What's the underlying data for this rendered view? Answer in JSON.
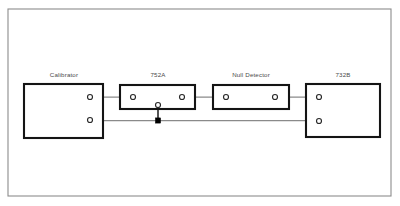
{
  "diagram": {
    "frame": {
      "x": 8,
      "y": 9,
      "width": 383,
      "height": 187
    },
    "blocks": [
      {
        "id": "calibrator",
        "label": "Calibrator",
        "x": 24,
        "y": 84,
        "width": 79,
        "height": 54,
        "label_x": 64,
        "label_y": 77
      },
      {
        "id": "752a",
        "label": "752A",
        "x": 120,
        "y": 85,
        "width": 75,
        "height": 24,
        "label_x": 158,
        "label_y": 77
      },
      {
        "id": "null-detector",
        "label": "Null Detector",
        "x": 213,
        "y": 85,
        "width": 76,
        "height": 24,
        "label_x": 251,
        "label_y": 77
      },
      {
        "id": "732b",
        "label": "732B",
        "x": 306,
        "y": 84,
        "width": 74,
        "height": 53,
        "label_x": 343,
        "label_y": 77
      }
    ],
    "terminals": [
      {
        "id": "calibrator-hi",
        "cx": 90,
        "cy": 97,
        "r": 2.5
      },
      {
        "id": "calibrator-lo",
        "cx": 90,
        "cy": 120,
        "r": 2.5
      },
      {
        "id": "752a-in",
        "cx": 133,
        "cy": 97,
        "r": 2.5
      },
      {
        "id": "752a-out",
        "cx": 182,
        "cy": 97,
        "r": 2.5
      },
      {
        "id": "752a-common",
        "cx": 158,
        "cy": 105,
        "r": 2.5
      },
      {
        "id": "null-detector-in",
        "cx": 226,
        "cy": 97,
        "r": 2.5
      },
      {
        "id": "null-detector-out",
        "cx": 275,
        "cy": 97,
        "r": 2.5
      },
      {
        "id": "732b-hi",
        "cx": 319,
        "cy": 97,
        "r": 2.5
      },
      {
        "id": "732b-lo",
        "cx": 319,
        "cy": 121,
        "r": 2.5
      }
    ],
    "wires": [
      {
        "id": "wire-calibrator-to-752a",
        "points": "92.5,97 130.5,97"
      },
      {
        "id": "wire-752a-to-null-detector",
        "points": "184.5,97 223.5,97"
      },
      {
        "id": "wire-null-detector-to-732b",
        "points": "277.5,97 316.5,97"
      },
      {
        "id": "wire-common-return",
        "points": "92.5,120.5 316.5,120.5"
      }
    ],
    "vertical_wires": [
      {
        "id": "wire-752a-common-drop",
        "points": "158,107 158,120.5"
      }
    ],
    "junctions": [
      {
        "id": "common-node-junction",
        "x": 155.4,
        "y": 117.9,
        "size": 5.2
      }
    ],
    "colors": {
      "frame_stroke": "#8c8c8c",
      "block_stroke": "#141414",
      "wire_stroke": "#8a8a8a",
      "vertical_wire_stroke": "#1d1d1d",
      "terminal_fill": "#ffffff",
      "terminal_stroke": "#2a2a2a",
      "junction_fill": "#000000",
      "label_fill": "#4a4a4a",
      "background": "#ffffff"
    }
  }
}
